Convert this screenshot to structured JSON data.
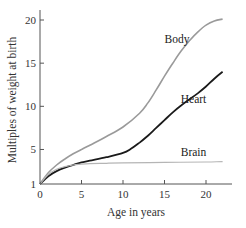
{
  "chart_data": {
    "type": "line",
    "title": "",
    "xlabel": "Age in years",
    "ylabel": "Multiples of weight at birth",
    "xlim": [
      0,
      23
    ],
    "ylim": [
      1,
      21
    ],
    "xticks": [
      0,
      5,
      10,
      15,
      20
    ],
    "xtick_labels": [
      "0",
      "5",
      "10",
      "15",
      "20"
    ],
    "yticks": [
      1,
      5,
      10,
      15,
      20
    ],
    "ytick_labels": [
      "1",
      "5",
      "10",
      "15",
      "20"
    ],
    "grid": false,
    "legend": "inline labels",
    "series": [
      {
        "name": "Body",
        "color": "#9a9a9a",
        "x": [
          0,
          1,
          2,
          3,
          4,
          5,
          6,
          8,
          10,
          12,
          13,
          14,
          15,
          16,
          17,
          18,
          19,
          20,
          21,
          22
        ],
        "values": [
          1,
          2.3,
          3.2,
          3.9,
          4.5,
          5.0,
          5.5,
          6.5,
          7.6,
          9.2,
          10.4,
          11.9,
          13.5,
          15.0,
          16.4,
          17.6,
          18.6,
          19.4,
          19.9,
          20.1
        ]
      },
      {
        "name": "Heart",
        "color": "#1a1a1a",
        "x": [
          0,
          1,
          2,
          3,
          4,
          5,
          6,
          8,
          10,
          11,
          12,
          13,
          14,
          15,
          16,
          17,
          18,
          19,
          20,
          21,
          22
        ],
        "values": [
          1,
          1.9,
          2.5,
          2.9,
          3.2,
          3.5,
          3.7,
          4.1,
          4.6,
          5.1,
          5.8,
          6.6,
          7.5,
          8.4,
          9.3,
          10.1,
          10.8,
          11.5,
          12.3,
          13.2,
          14.0
        ]
      },
      {
        "name": "Brain",
        "color": "#b5b5b5",
        "x": [
          0,
          1,
          2,
          3,
          4,
          5,
          6,
          8,
          10,
          15,
          20,
          22
        ],
        "values": [
          1,
          2.1,
          2.7,
          3.0,
          3.2,
          3.3,
          3.35,
          3.4,
          3.45,
          3.5,
          3.55,
          3.6
        ]
      }
    ],
    "annotations": [
      {
        "text": "Body",
        "x": 16.5,
        "y": 17.3
      },
      {
        "text": "Heart",
        "x": 18.5,
        "y": 10.4
      },
      {
        "text": "Brain",
        "x": 18.5,
        "y": 4.3
      }
    ]
  }
}
